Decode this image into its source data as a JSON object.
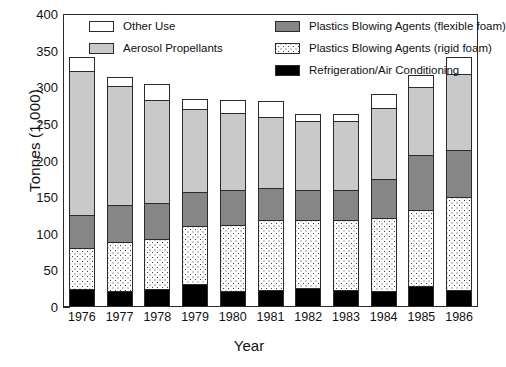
{
  "chart_data": {
    "type": "bar",
    "title": "",
    "xlabel": "Year",
    "ylabel": "Tonnes (1,000)",
    "ylim": [
      0,
      400
    ],
    "yticks": [
      0,
      50,
      100,
      150,
      200,
      250,
      300,
      350,
      400
    ],
    "grid": false,
    "stacked": true,
    "legend_position": "top-inside",
    "categories": [
      "1976",
      "1977",
      "1978",
      "1979",
      "1980",
      "1981",
      "1982",
      "1983",
      "1984",
      "1985",
      "1986"
    ],
    "series": [
      {
        "name": "Refrigeration/Air Conditioning",
        "color": "#000000",
        "pattern": "solid-black",
        "values": [
          23,
          20,
          23,
          30,
          20,
          22,
          25,
          22,
          20,
          27,
          22
        ]
      },
      {
        "name": "Plastics Blowing Agents (rigid foam)",
        "color": "#ffffff",
        "pattern": "dotted",
        "values": [
          56,
          68,
          68,
          79,
          91,
          95,
          93,
          96,
          100,
          104,
          127
        ]
      },
      {
        "name": "Plastics Blowing Agents (flexible foam)",
        "color": "#868686",
        "pattern": "solid-gray",
        "values": [
          45,
          50,
          50,
          47,
          47,
          44,
          41,
          41,
          54,
          75,
          64
        ]
      },
      {
        "name": "Aerosol Propellants",
        "color": "#c9c9c9",
        "pattern": "solid-lightgray",
        "values": [
          197,
          163,
          140,
          113,
          105,
          97,
          94,
          94,
          97,
          93,
          104
        ]
      },
      {
        "name": "Other Use",
        "color": "#ffffff",
        "pattern": "solid-white",
        "values": [
          19,
          12,
          22,
          14,
          18,
          22,
          9,
          9,
          18,
          16,
          23
        ]
      }
    ],
    "totals": [
      340,
      313,
      303,
      283,
      281,
      280,
      262,
      262,
      289,
      315,
      340
    ]
  },
  "legend": {
    "items": [
      {
        "label": "Other Use",
        "key": "other"
      },
      {
        "label": "Aerosol Propellants",
        "key": "aerosol"
      },
      {
        "label": "Plastics Blowing Agents (flexible foam)",
        "key": "flex"
      },
      {
        "label": "Plastics Blowing Agents (rigid foam)",
        "key": "rigid"
      },
      {
        "label": "Refrigeration/Air Conditioning",
        "key": "refrig"
      }
    ]
  }
}
